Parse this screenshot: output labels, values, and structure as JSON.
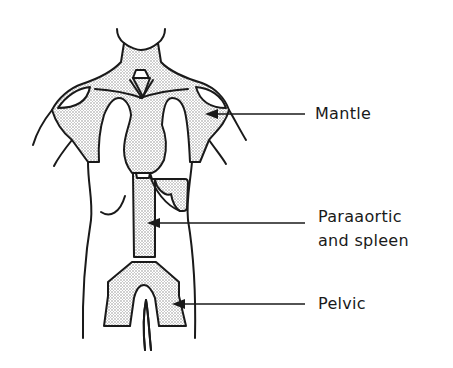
{
  "figure": {
    "fields": [
      {
        "id": "mantle",
        "label": "Mantle"
      },
      {
        "id": "paraaortic",
        "label_line1": "Paraaortic",
        "label_line2": "and spleen"
      },
      {
        "id": "pelvic",
        "label": "Pelvic"
      }
    ]
  },
  "colors": {
    "ink": "#1a1a1a",
    "stipple": "#9a9a9a",
    "background": "#ffffff"
  }
}
